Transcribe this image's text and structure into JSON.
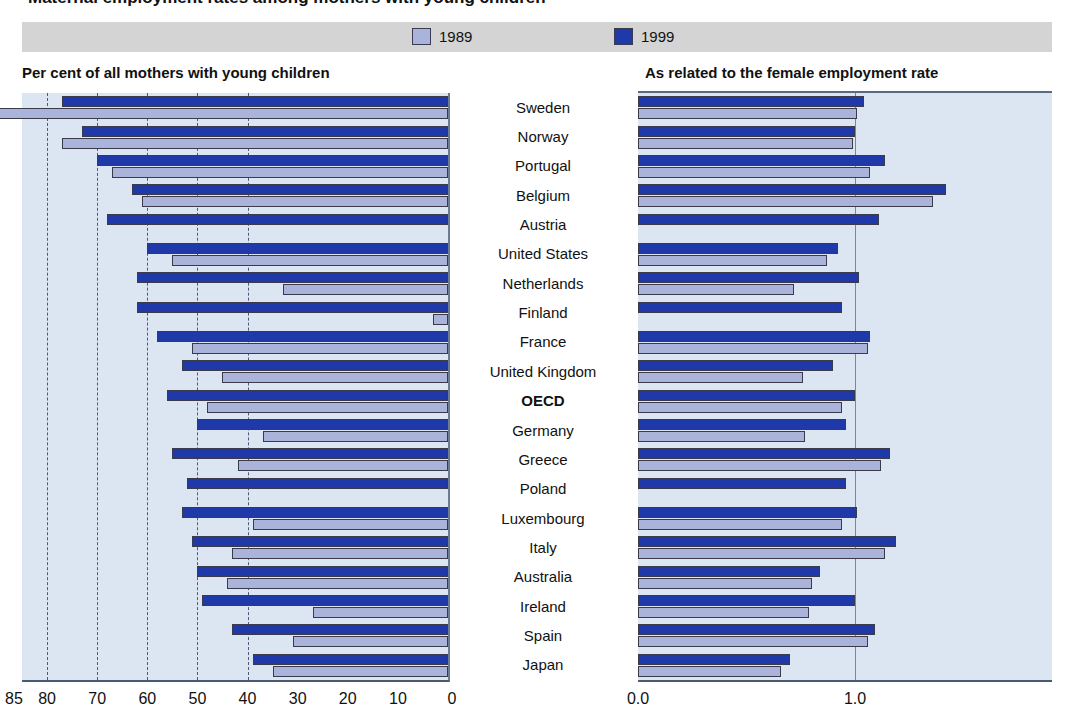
{
  "figure": {
    "cut_title": "Maternal employment rates among mothers with young children",
    "legend": [
      {
        "label": "1989",
        "color": "#aab4da"
      },
      {
        "label": "1999",
        "color": "#1f3aa8"
      }
    ],
    "panels": {
      "left_heading": "Per cent of all mothers with young children",
      "right_heading": "As related to the female employment rate"
    }
  },
  "chart_data": {
    "type": "bar",
    "title": "Maternal employment rates among mothers with young children",
    "orientation": "horizontal",
    "panels": [
      {
        "id": "left",
        "title": "Per cent of all mothers with young children",
        "xlabel": "",
        "ylabel": "",
        "xlim": [
          85,
          0
        ],
        "reversed_axis": true,
        "ticks": [
          85,
          80,
          70,
          60,
          50,
          40,
          30,
          20,
          10,
          0
        ],
        "gridlines": [
          80,
          70,
          60,
          50,
          40
        ],
        "grid": true,
        "categories": [
          "Sweden",
          "Norway",
          "Portugal",
          "Belgium",
          "Austria",
          "United States",
          "Netherlands",
          "Finland",
          "France",
          "United Kingdom",
          "OECD",
          "Germany",
          "Greece",
          "Poland",
          "Luxembourg",
          "Italy",
          "Australia",
          "Ireland",
          "Spain",
          "Japan"
        ],
        "series": [
          {
            "name": "1989",
            "color": "#aab4da",
            "values": [
              91,
              77,
              67,
              61,
              0,
              55,
              33,
              3,
              51,
              45,
              48,
              37,
              42,
              0,
              39,
              43,
              44,
              27,
              31,
              35
            ]
          },
          {
            "name": "1999",
            "color": "#1f3aa8",
            "values": [
              77,
              73,
              70,
              63,
              68,
              60,
              62,
              62,
              58,
              53,
              56,
              50,
              55,
              52,
              53,
              51,
              50,
              49,
              43,
              39
            ]
          }
        ]
      },
      {
        "id": "right",
        "title": "As related to the female employment rate",
        "xlabel": "",
        "ylabel": "",
        "xlim": [
          0.0,
          1.9
        ],
        "ticks": [
          0.0,
          1.0
        ],
        "reference_line": 1.0,
        "grid": false,
        "categories": [
          "Sweden",
          "Norway",
          "Portugal",
          "Belgium",
          "Austria",
          "United States",
          "Netherlands",
          "Finland",
          "France",
          "United Kingdom",
          "OECD",
          "Germany",
          "Greece",
          "Poland",
          "Luxembourg",
          "Italy",
          "Australia",
          "Ireland",
          "Spain",
          "Japan"
        ],
        "series": [
          {
            "name": "1989",
            "color": "#aab4da",
            "values": [
              1.01,
              0.99,
              1.07,
              1.36,
              0.0,
              0.87,
              0.72,
              0.0,
              1.06,
              0.76,
              0.94,
              0.77,
              1.12,
              0.0,
              0.94,
              1.14,
              0.8,
              0.79,
              1.06,
              0.66
            ]
          },
          {
            "name": "1999",
            "color": "#1f3aa8",
            "values": [
              1.04,
              1.0,
              1.14,
              1.42,
              1.11,
              0.92,
              1.02,
              0.94,
              1.07,
              0.9,
              1.0,
              0.96,
              1.16,
              0.96,
              1.01,
              1.19,
              0.84,
              1.0,
              1.09,
              0.7
            ]
          }
        ]
      }
    ]
  },
  "axis_left": {
    "tick_labels": [
      "85",
      "80",
      "70",
      "60",
      "50",
      "40",
      "30",
      "20",
      "10",
      "0"
    ]
  },
  "axis_right": {
    "tick_labels": [
      "0.0",
      "1.0"
    ]
  },
  "countries": [
    {
      "name": "Sweden",
      "highlight": false
    },
    {
      "name": "Norway",
      "highlight": false
    },
    {
      "name": "Portugal",
      "highlight": false
    },
    {
      "name": "Belgium",
      "highlight": false
    },
    {
      "name": "Austria",
      "highlight": false
    },
    {
      "name": "United States",
      "highlight": false
    },
    {
      "name": "Netherlands",
      "highlight": false
    },
    {
      "name": "Finland",
      "highlight": false
    },
    {
      "name": "France",
      "highlight": false
    },
    {
      "name": "United Kingdom",
      "highlight": false
    },
    {
      "name": "OECD",
      "highlight": true
    },
    {
      "name": "Germany",
      "highlight": false
    },
    {
      "name": "Greece",
      "highlight": false
    },
    {
      "name": "Poland",
      "highlight": false
    },
    {
      "name": "Luxembourg",
      "highlight": false
    },
    {
      "name": "Italy",
      "highlight": false
    },
    {
      "name": "Australia",
      "highlight": false
    },
    {
      "name": "Ireland",
      "highlight": false
    },
    {
      "name": "Spain",
      "highlight": false
    },
    {
      "name": "Japan",
      "highlight": false
    }
  ]
}
